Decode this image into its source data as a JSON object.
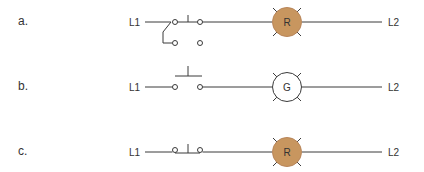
{
  "diagrams": [
    {
      "label": "a.",
      "left_terminal": "L1",
      "right_terminal": "L2",
      "switch_type": "two-position selector switch",
      "lamp": {
        "letter": "R",
        "state": "lit",
        "fill": "#c8965f"
      }
    },
    {
      "label": "b.",
      "left_terminal": "L1",
      "right_terminal": "L2",
      "switch_type": "normally open pushbutton",
      "lamp": {
        "letter": "G",
        "state": "off",
        "fill": "#ffffff"
      }
    },
    {
      "label": "c.",
      "left_terminal": "L1",
      "right_terminal": "L2",
      "switch_type": "normally closed pushbutton",
      "lamp": {
        "letter": "R",
        "state": "lit",
        "fill": "#c8965f"
      }
    }
  ],
  "colors": {
    "wire": "#3a3a3a",
    "lamp_lit": "#c8965f",
    "lamp_off": "#ffffff"
  }
}
